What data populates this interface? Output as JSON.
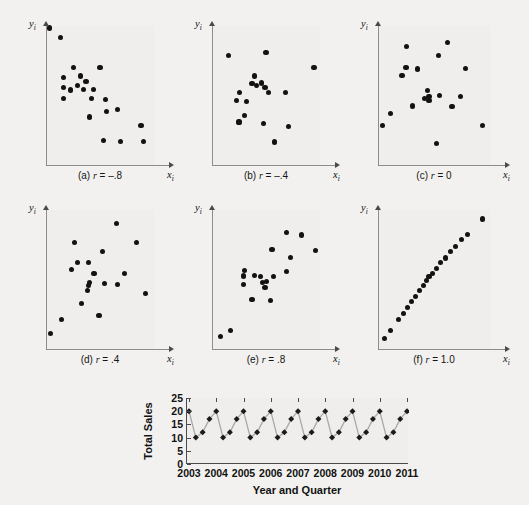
{
  "figure": {
    "axis_labels": {
      "y": "y",
      "y_sub": "i",
      "x": "x",
      "x_sub": "i"
    }
  },
  "chart_data": [
    {
      "type": "scatter",
      "title": "(a) r = -.8",
      "caption_prefix": "(a)",
      "caption_stat": "r",
      "caption_value": "= –.8",
      "correlation": -0.8,
      "xlabel": "x_i",
      "ylabel": "y_i",
      "grid": false,
      "legend": "none",
      "xlim": [
        0,
        1
      ],
      "ylim": [
        0,
        1
      ],
      "points": [
        [
          0.035,
          0.985
        ],
        [
          0.135,
          0.915
        ],
        [
          0.255,
          0.7
        ],
        [
          0.5,
          0.7
        ],
        [
          0.16,
          0.63
        ],
        [
          0.32,
          0.64
        ],
        [
          0.37,
          0.6
        ],
        [
          0.16,
          0.555
        ],
        [
          0.29,
          0.57
        ],
        [
          0.23,
          0.54
        ],
        [
          0.345,
          0.545
        ],
        [
          0.44,
          0.545
        ],
        [
          0.16,
          0.48
        ],
        [
          0.42,
          0.48
        ],
        [
          0.55,
          0.47
        ],
        [
          0.56,
          0.385
        ],
        [
          0.66,
          0.4
        ],
        [
          0.405,
          0.345
        ],
        [
          0.88,
          0.285
        ],
        [
          0.53,
          0.175
        ],
        [
          0.69,
          0.17
        ],
        [
          0.9,
          0.17
        ]
      ]
    },
    {
      "type": "scatter",
      "title": "(b) r = -.4",
      "caption_prefix": "(b)",
      "caption_stat": "r",
      "caption_value": "= –.4",
      "correlation": -0.4,
      "xlabel": "x_i",
      "ylabel": "y_i",
      "grid": false,
      "legend": "none",
      "xlim": [
        0,
        1
      ],
      "ylim": [
        0,
        1
      ],
      "points": [
        [
          0.15,
          0.79
        ],
        [
          0.5,
          0.81
        ],
        [
          0.945,
          0.7
        ],
        [
          0.39,
          0.64
        ],
        [
          0.37,
          0.585
        ],
        [
          0.455,
          0.59
        ],
        [
          0.41,
          0.57
        ],
        [
          0.49,
          0.56
        ],
        [
          0.255,
          0.52
        ],
        [
          0.525,
          0.52
        ],
        [
          0.68,
          0.52
        ],
        [
          0.23,
          0.465
        ],
        [
          0.32,
          0.455
        ],
        [
          0.3,
          0.355
        ],
        [
          0.25,
          0.31
        ],
        [
          0.48,
          0.3
        ],
        [
          0.71,
          0.275
        ],
        [
          0.58,
          0.165
        ]
      ]
    },
    {
      "type": "scatter",
      "title": "(c) r = 0",
      "caption_prefix": "(c)",
      "caption_stat": "r",
      "caption_value": "= 0",
      "correlation": 0.0,
      "xlabel": "x_i",
      "ylabel": "y_i",
      "grid": false,
      "legend": "none",
      "xlim": [
        0,
        1
      ],
      "ylim": [
        0,
        1
      ],
      "points": [
        [
          0.255,
          0.855
        ],
        [
          0.62,
          0.88
        ],
        [
          0.54,
          0.79
        ],
        [
          0.25,
          0.7
        ],
        [
          0.355,
          0.69
        ],
        [
          0.78,
          0.695
        ],
        [
          0.215,
          0.645
        ],
        [
          0.44,
          0.535
        ],
        [
          0.415,
          0.48
        ],
        [
          0.455,
          0.49
        ],
        [
          0.455,
          0.465
        ],
        [
          0.55,
          0.5
        ],
        [
          0.735,
          0.49
        ],
        [
          0.31,
          0.425
        ],
        [
          0.66,
          0.42
        ],
        [
          0.11,
          0.37
        ],
        [
          0.04,
          0.285
        ],
        [
          0.93,
          0.285
        ],
        [
          0.52,
          0.155
        ]
      ]
    },
    {
      "type": "scatter",
      "title": "(d) r = .4",
      "caption_prefix": "(d)",
      "caption_stat": "r",
      "caption_value": "= .4",
      "correlation": 0.4,
      "xlabel": "x_i",
      "ylabel": "y_i",
      "grid": false,
      "legend": "none",
      "xlim": [
        0,
        1
      ],
      "ylim": [
        0,
        1
      ],
      "points": [
        [
          0.65,
          0.9
        ],
        [
          0.84,
          0.765
        ],
        [
          0.265,
          0.765
        ],
        [
          0.52,
          0.7
        ],
        [
          0.29,
          0.62
        ],
        [
          0.395,
          0.62
        ],
        [
          0.235,
          0.57
        ],
        [
          0.445,
          0.545
        ],
        [
          0.73,
          0.545
        ],
        [
          0.405,
          0.48
        ],
        [
          0.39,
          0.455
        ],
        [
          0.545,
          0.47
        ],
        [
          0.66,
          0.465
        ],
        [
          0.385,
          0.42
        ],
        [
          0.925,
          0.4
        ],
        [
          0.33,
          0.33
        ],
        [
          0.49,
          0.24
        ],
        [
          0.14,
          0.21
        ],
        [
          0.045,
          0.11
        ]
      ]
    },
    {
      "type": "scatter",
      "title": "(e) r = .8",
      "caption_prefix": "(e)",
      "caption_stat": "r",
      "caption_value": "= .8",
      "correlation": 0.8,
      "xlabel": "x_i",
      "ylabel": "y_i",
      "grid": false,
      "legend": "none",
      "xlim": [
        0,
        1
      ],
      "ylim": [
        0,
        1
      ],
      "points": [
        [
          0.69,
          0.84
        ],
        [
          0.83,
          0.82
        ],
        [
          0.96,
          0.71
        ],
        [
          0.555,
          0.715
        ],
        [
          0.73,
          0.66
        ],
        [
          0.3,
          0.565
        ],
        [
          0.69,
          0.555
        ],
        [
          0.39,
          0.53
        ],
        [
          0.295,
          0.525
        ],
        [
          0.45,
          0.52
        ],
        [
          0.57,
          0.52
        ],
        [
          0.47,
          0.48
        ],
        [
          0.505,
          0.485
        ],
        [
          0.295,
          0.465
        ],
        [
          0.49,
          0.44
        ],
        [
          0.37,
          0.355
        ],
        [
          0.545,
          0.35
        ],
        [
          0.175,
          0.135
        ],
        [
          0.075,
          0.09
        ]
      ]
    },
    {
      "type": "scatter",
      "title": "(f) r = 1.0",
      "caption_prefix": "(f)",
      "caption_stat": "r",
      "caption_value": "= 1.0",
      "correlation": 1.0,
      "xlabel": "x_i",
      "ylabel": "y_i",
      "grid": false,
      "legend": "none",
      "xlim": [
        0,
        1
      ],
      "ylim": [
        0,
        1
      ],
      "points": [
        [
          0.06,
          0.075
        ],
        [
          0.115,
          0.135
        ],
        [
          0.185,
          0.215
        ],
        [
          0.225,
          0.255
        ],
        [
          0.265,
          0.3
        ],
        [
          0.3,
          0.34
        ],
        [
          0.335,
          0.38
        ],
        [
          0.37,
          0.42
        ],
        [
          0.405,
          0.455
        ],
        [
          0.43,
          0.49
        ],
        [
          0.455,
          0.52
        ],
        [
          0.485,
          0.545
        ],
        [
          0.52,
          0.58
        ],
        [
          0.555,
          0.62
        ],
        [
          0.6,
          0.655
        ],
        [
          0.645,
          0.7
        ],
        [
          0.695,
          0.74
        ],
        [
          0.745,
          0.79
        ],
        [
          0.8,
          0.825
        ],
        [
          0.93,
          0.935
        ]
      ]
    },
    {
      "type": "line",
      "title": "",
      "xlabel": "Year and Quarter",
      "ylabel": "Total Sales",
      "ylim": [
        0,
        25
      ],
      "yticks": [
        0,
        5,
        10,
        15,
        20,
        25
      ],
      "xticks": [
        "2003",
        "2004",
        "2005",
        "2006",
        "2007",
        "2008",
        "2009",
        "2010",
        "2011"
      ],
      "grid": false,
      "legend": "none",
      "marker": "diamond",
      "series": [
        {
          "name": "Total Sales",
          "values": [
            20,
            10,
            12,
            17,
            20,
            10,
            12,
            17,
            20,
            10,
            12,
            17,
            20,
            10,
            12,
            17,
            20,
            10,
            12,
            17,
            20,
            10,
            12,
            17,
            20,
            10,
            12,
            17,
            20,
            10,
            12,
            17,
            20
          ]
        }
      ]
    }
  ]
}
